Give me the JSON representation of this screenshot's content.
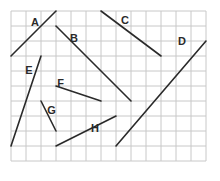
{
  "grid": {
    "origin_px": [
      11,
      11
    ],
    "cell_px": 15,
    "columns": 13,
    "rows": 10,
    "line_color": "#c8c8c8"
  },
  "segments": [
    {
      "label": "A",
      "from": [
        0,
        3
      ],
      "to": [
        3,
        0
      ],
      "label_pos": [
        1.6,
        0.7
      ]
    },
    {
      "label": "B",
      "from": [
        3,
        1
      ],
      "to": [
        8,
        6
      ],
      "label_pos": [
        4.2,
        1.8
      ]
    },
    {
      "label": "C",
      "from": [
        6,
        0
      ],
      "to": [
        10,
        3
      ],
      "label_pos": [
        7.6,
        0.6
      ]
    },
    {
      "label": "D",
      "from": [
        7,
        9
      ],
      "to": [
        13,
        2
      ],
      "label_pos": [
        11.4,
        2.0
      ]
    },
    {
      "label": "E",
      "from": [
        2,
        3
      ],
      "to": [
        0,
        9
      ],
      "label_pos": [
        1.2,
        3.9
      ]
    },
    {
      "label": "F",
      "from": [
        3,
        5
      ],
      "to": [
        6,
        6
      ],
      "label_pos": [
        3.3,
        4.8
      ]
    },
    {
      "label": "G",
      "from": [
        2,
        6
      ],
      "to": [
        3,
        8
      ],
      "label_pos": [
        2.7,
        6.6
      ]
    },
    {
      "label": "H",
      "from": [
        3,
        9
      ],
      "to": [
        7,
        7
      ],
      "label_pos": [
        5.6,
        7.8
      ]
    }
  ],
  "line_color": "#2a2a2a"
}
